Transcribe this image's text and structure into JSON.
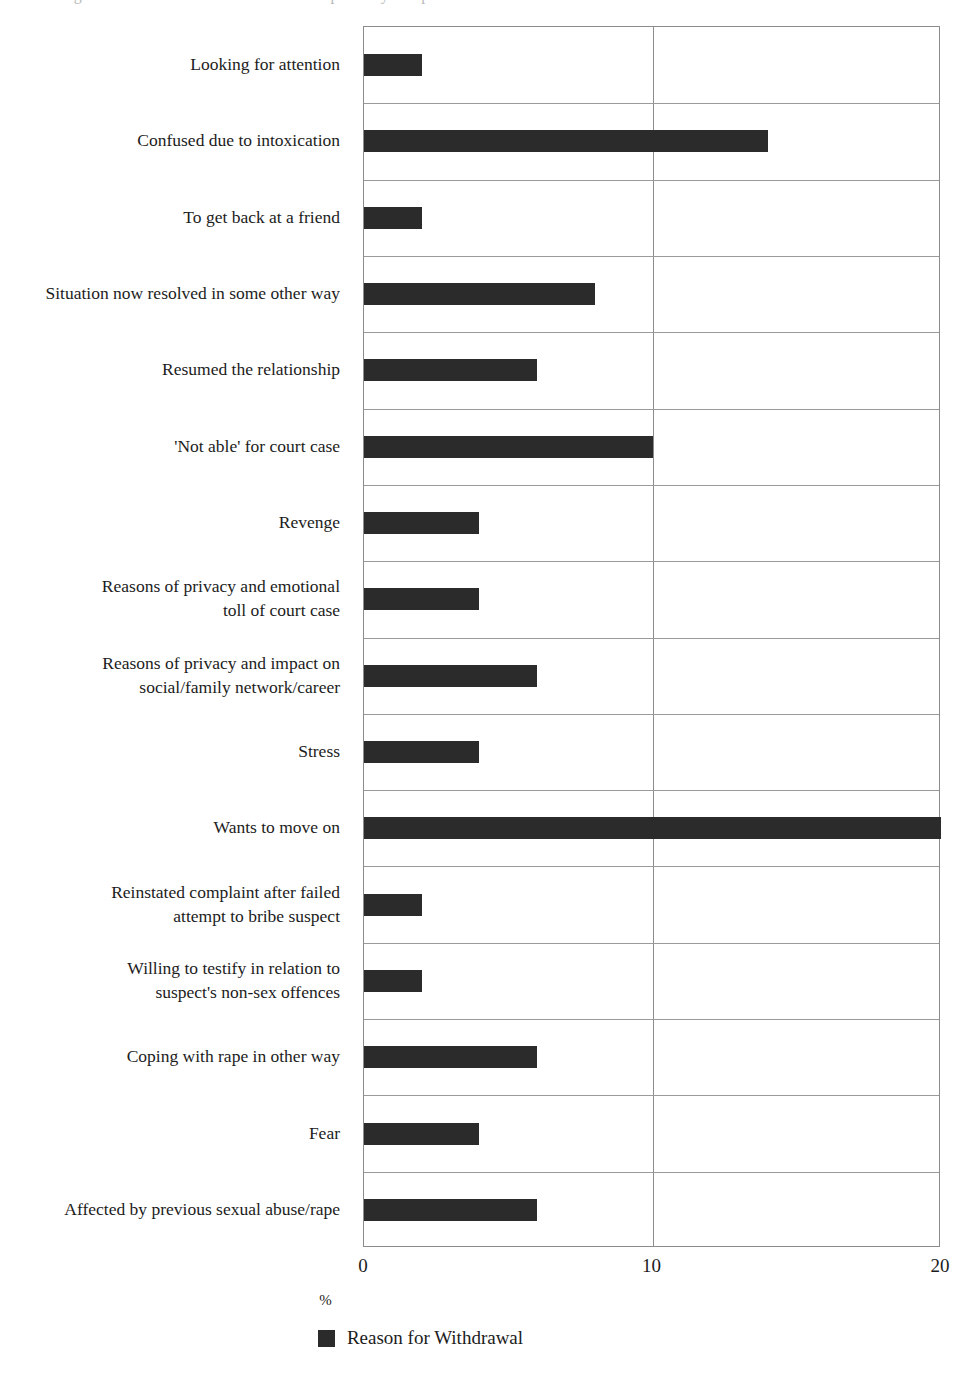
{
  "caption": {
    "clipped_top_text": "Figure ... Reasons for withdrawal of complaint by complainants"
  },
  "chart_data": {
    "type": "bar",
    "orientation": "horizontal",
    "title": "",
    "xlabel": "%",
    "ylabel": "",
    "xlim": [
      0,
      20
    ],
    "xticks": [
      0,
      10,
      20
    ],
    "xtick_labels": [
      "0",
      "10",
      "20"
    ],
    "grid": "vertical-at-10-and-horizontal-category-separators",
    "legend": {
      "position": "bottom-center",
      "entries": [
        {
          "label": "Reason for Withdrawal",
          "color": "#2b2b2b"
        }
      ]
    },
    "series": [
      {
        "name": "Reason for Withdrawal",
        "color": "#2b2b2b",
        "values": [
          2,
          14,
          2,
          8,
          6,
          10,
          4,
          4,
          6,
          4,
          20,
          2,
          2,
          6,
          4,
          6
        ]
      }
    ],
    "categories": [
      "Looking for attention",
      "Confused due to intoxication",
      "To get back at a friend",
      "Situation now resolved in some other way",
      "Resumed the relationship",
      "'Not able' for court case",
      "Revenge",
      "Reasons of privacy and emotional\ntoll of court case",
      "Reasons of privacy and impact on\nsocial/family network/career",
      "Stress",
      "Wants to move on",
      "Reinstated complaint after failed\nattempt to bribe suspect",
      "Willing to testify in relation to\nsuspect's non-sex offences",
      "Coping with rape in other way",
      "Fear",
      "Affected by previous sexual abuse/rape"
    ]
  },
  "colors": {
    "bar": "#2b2b2b",
    "gridline": "#9a9a9a",
    "axis": "#8c8c8c",
    "text": "#1c1c1c",
    "background": "#ffffff"
  }
}
